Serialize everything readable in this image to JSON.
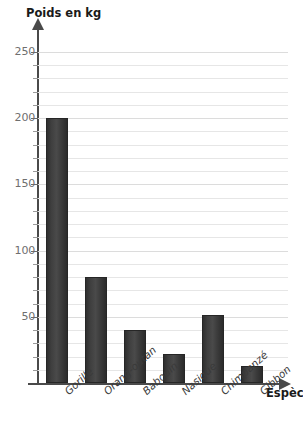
{
  "chart_data": {
    "type": "bar",
    "title": "",
    "xlabel": "Espèces",
    "ylabel": "Poids en kg",
    "categories": [
      "Gorille",
      "Orang-outan",
      "Babouin",
      "Nasique",
      "Chimpanzé",
      "Gibbon"
    ],
    "values": [
      200,
      80,
      40,
      22,
      51,
      13
    ],
    "ylim": [
      0,
      255
    ],
    "ytick_labels": [
      "250",
      "200",
      "150",
      "100",
      "50"
    ],
    "ytick_values": [
      250,
      200,
      150,
      100,
      50
    ],
    "minor_tick_step": 10,
    "grid": true,
    "grid_orientation": "horizontal",
    "legend": null,
    "bar_color": "#3a3a3a",
    "grid_color": "#e6e6e6",
    "axis_color": "#4a4a4a",
    "tick_label_color": "#6f6f6f"
  },
  "axes": {
    "y_title": "Poids en kg",
    "x_title": "Espèces"
  }
}
